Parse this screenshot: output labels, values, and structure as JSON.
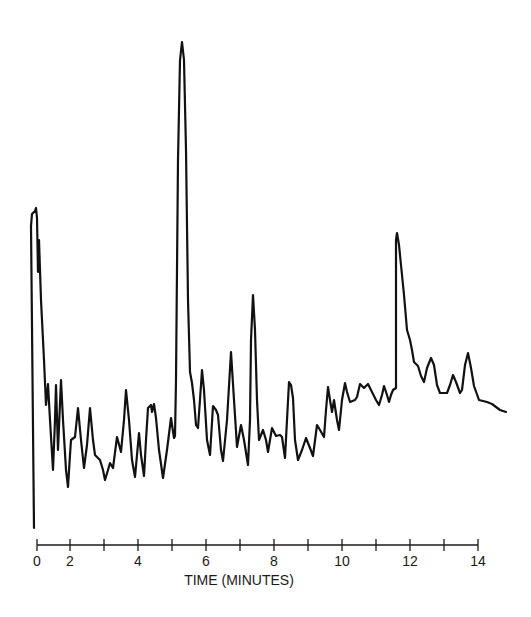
{
  "chart_data": {
    "type": "line",
    "title": "",
    "xlabel": "TIME (MINUTES)",
    "ylabel": "",
    "grid": false,
    "legend": null,
    "x_axis": {
      "tick_count": 14,
      "tick_pixel_x": [
        37,
        70,
        104,
        138,
        172,
        206,
        240,
        274,
        308,
        342,
        376,
        410,
        444,
        478
      ],
      "labels": [
        {
          "text": "0",
          "tick_index": 0
        },
        {
          "text": "2",
          "tick_index": 1
        },
        {
          "text": "4",
          "tick_index": 3
        },
        {
          "text": "6",
          "tick_index": 5
        },
        {
          "text": "8",
          "tick_index": 7
        },
        {
          "text": "10",
          "tick_index": 9
        },
        {
          "text": "12",
          "tick_index": 11
        },
        {
          "text": "14",
          "tick_index": 13
        }
      ],
      "xlim": [
        0,
        14
      ]
    },
    "series": [
      {
        "name": "chromatogram trace",
        "color": "#111111",
        "description": "Detector response vs. time; pixel-space polyline (x px, y px).",
        "major_peaks_minutes_approx": [
          0.0,
          5.0,
          7.3,
          11.5
        ],
        "points_px": [
          [
            34,
            528
          ],
          [
            31,
            226
          ],
          [
            32,
            214
          ],
          [
            35,
            211
          ],
          [
            36,
            208
          ],
          [
            37,
            218
          ],
          [
            38,
            272
          ],
          [
            39,
            240
          ],
          [
            41,
            300
          ],
          [
            44,
            360
          ],
          [
            46,
            405
          ],
          [
            48,
            384
          ],
          [
            50,
            420
          ],
          [
            53,
            470
          ],
          [
            55,
            420
          ],
          [
            56,
            385
          ],
          [
            58,
            450
          ],
          [
            61,
            380
          ],
          [
            63,
            420
          ],
          [
            66,
            470
          ],
          [
            68,
            487
          ],
          [
            70,
            455
          ],
          [
            71,
            440
          ],
          [
            75,
            437
          ],
          [
            78,
            408
          ],
          [
            81,
            440
          ],
          [
            84,
            468
          ],
          [
            87,
            445
          ],
          [
            90,
            408
          ],
          [
            93,
            440
          ],
          [
            95,
            455
          ],
          [
            100,
            460
          ],
          [
            103,
            470
          ],
          [
            105,
            480
          ],
          [
            108,
            470
          ],
          [
            110,
            463
          ],
          [
            113,
            468
          ],
          [
            117,
            437
          ],
          [
            121,
            452
          ],
          [
            124,
            420
          ],
          [
            126,
            390
          ],
          [
            129,
            420
          ],
          [
            132,
            460
          ],
          [
            135,
            477
          ],
          [
            139,
            433
          ],
          [
            141,
            455
          ],
          [
            144,
            476
          ],
          [
            146,
            440
          ],
          [
            148,
            408
          ],
          [
            151,
            405
          ],
          [
            152,
            412
          ],
          [
            154,
            404
          ],
          [
            156,
            418
          ],
          [
            159,
            450
          ],
          [
            163,
            478
          ],
          [
            167,
            450
          ],
          [
            171,
            418
          ],
          [
            174,
            438
          ],
          [
            175,
            436
          ],
          [
            176,
            380
          ],
          [
            178,
            160
          ],
          [
            180,
            60
          ],
          [
            182,
            42
          ],
          [
            184,
            60
          ],
          [
            186,
            150
          ],
          [
            188,
            300
          ],
          [
            190,
            372
          ],
          [
            192,
            383
          ],
          [
            194,
            400
          ],
          [
            196,
            425
          ],
          [
            198,
            428
          ],
          [
            201,
            385
          ],
          [
            202,
            370
          ],
          [
            204,
            390
          ],
          [
            207,
            440
          ],
          [
            210,
            455
          ],
          [
            213,
            406
          ],
          [
            216,
            410
          ],
          [
            218,
            415
          ],
          [
            221,
            450
          ],
          [
            223,
            461
          ],
          [
            227,
            420
          ],
          [
            231,
            352
          ],
          [
            234,
            400
          ],
          [
            237,
            447
          ],
          [
            241,
            425
          ],
          [
            244,
            440
          ],
          [
            248,
            465
          ],
          [
            250,
            420
          ],
          [
            251,
            340
          ],
          [
            253,
            295
          ],
          [
            255,
            330
          ],
          [
            257,
            400
          ],
          [
            259,
            440
          ],
          [
            263,
            430
          ],
          [
            266,
            440
          ],
          [
            268,
            452
          ],
          [
            272,
            428
          ],
          [
            276,
            436
          ],
          [
            280,
            435
          ],
          [
            282,
            437
          ],
          [
            285,
            458
          ],
          [
            287,
            420
          ],
          [
            289,
            382
          ],
          [
            291,
            385
          ],
          [
            293,
            398
          ],
          [
            295,
            440
          ],
          [
            298,
            460
          ],
          [
            302,
            450
          ],
          [
            306,
            438
          ],
          [
            310,
            448
          ],
          [
            313,
            456
          ],
          [
            317,
            425
          ],
          [
            320,
            430
          ],
          [
            324,
            437
          ],
          [
            326,
            410
          ],
          [
            328,
            387
          ],
          [
            330,
            400
          ],
          [
            332,
            412
          ],
          [
            334,
            400
          ],
          [
            337,
            420
          ],
          [
            339,
            430
          ],
          [
            342,
            400
          ],
          [
            345,
            383
          ],
          [
            347,
            392
          ],
          [
            350,
            402
          ],
          [
            355,
            400
          ],
          [
            357,
            397
          ],
          [
            360,
            384
          ],
          [
            364,
            388
          ],
          [
            368,
            384
          ],
          [
            372,
            392
          ],
          [
            376,
            400
          ],
          [
            379,
            405
          ],
          [
            382,
            395
          ],
          [
            384,
            386
          ],
          [
            387,
            395
          ],
          [
            389,
            402
          ],
          [
            391,
            395
          ],
          [
            393,
            390
          ],
          [
            396,
            388
          ],
          [
            396,
            300
          ],
          [
            396,
            240
          ],
          [
            397,
            233
          ],
          [
            399,
            245
          ],
          [
            401,
            265
          ],
          [
            404,
            295
          ],
          [
            407,
            330
          ],
          [
            410,
            340
          ],
          [
            412,
            350
          ],
          [
            414,
            362
          ],
          [
            418,
            366
          ],
          [
            421,
            376
          ],
          [
            424,
            382
          ],
          [
            427,
            368
          ],
          [
            431,
            358
          ],
          [
            434,
            365
          ],
          [
            437,
            385
          ],
          [
            440,
            393
          ],
          [
            444,
            393
          ],
          [
            447,
            393
          ],
          [
            450,
            385
          ],
          [
            453,
            375
          ],
          [
            456,
            382
          ],
          [
            460,
            393
          ],
          [
            462,
            390
          ],
          [
            465,
            365
          ],
          [
            468,
            353
          ],
          [
            471,
            368
          ],
          [
            474,
            386
          ],
          [
            479,
            400
          ],
          [
            483,
            401
          ],
          [
            487,
            402
          ],
          [
            492,
            404
          ],
          [
            496,
            407
          ],
          [
            500,
            410
          ],
          [
            506,
            412
          ]
        ]
      }
    ],
    "axis_color": "#1a1a1a",
    "background": "#ffffff"
  }
}
